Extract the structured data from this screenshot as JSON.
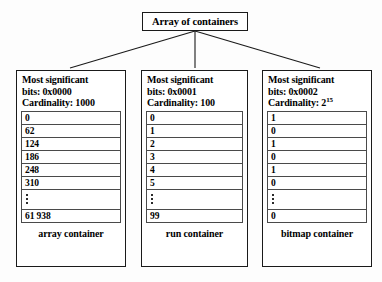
{
  "diagram": {
    "title": "Array of containers",
    "containers": [
      {
        "msb_line1": "Most significant",
        "msb_line2": "bits: 0x0000",
        "cardinality_label": "Cardinality: 1000",
        "cardinality_base": "Cardinality: 1000",
        "cardinality_exp": "",
        "rows": [
          "0",
          "62",
          "124",
          "186",
          "248",
          "310"
        ],
        "ellipsis": "⋮",
        "last_row": "61 938",
        "caption": "array container"
      },
      {
        "msb_line1": "Most significant",
        "msb_line2": "bits: 0x0001",
        "cardinality_label": "Cardinality: 100",
        "cardinality_base": "Cardinality: 100",
        "cardinality_exp": "",
        "rows": [
          "0",
          "1",
          "2",
          "3",
          "4",
          "5"
        ],
        "ellipsis": "⋮",
        "last_row": "99",
        "caption": "run container"
      },
      {
        "msb_line1": "Most significant",
        "msb_line2": "bits: 0x0002",
        "cardinality_label": "Cardinality: 2^15",
        "cardinality_base": "Cardinality: 2",
        "cardinality_exp": "15",
        "rows": [
          "1",
          "0",
          "1",
          "0",
          "1",
          "0"
        ],
        "ellipsis": "⋮",
        "last_row": "0",
        "caption": "bitmap container"
      }
    ],
    "colors": {
      "line": "#1a1a1a",
      "row_border": "#4a4a4a",
      "background": "#fdfdfd",
      "text": "#000000"
    }
  }
}
